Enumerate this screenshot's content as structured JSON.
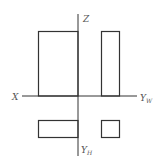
{
  "diagram": {
    "type": "three-view orthographic projection",
    "stroke_color": "#333333",
    "label_color": "#555555",
    "axes": {
      "vertical_top_label": "Z",
      "horizontal_left_label": "X",
      "horizontal_right_label": "Y",
      "horizontal_right_subscript": "W",
      "vertical_bottom_label": "Y",
      "vertical_bottom_subscript": "H"
    },
    "views": [
      {
        "name": "front-view",
        "x": 38,
        "y": 31,
        "w": 40,
        "h": 65
      },
      {
        "name": "side-view",
        "x": 101,
        "y": 31,
        "w": 18,
        "h": 65
      },
      {
        "name": "top-view",
        "x": 38,
        "y": 120,
        "w": 40,
        "h": 17
      },
      {
        "name": "auxiliary-square",
        "x": 101,
        "y": 120,
        "w": 18,
        "h": 17
      }
    ]
  }
}
